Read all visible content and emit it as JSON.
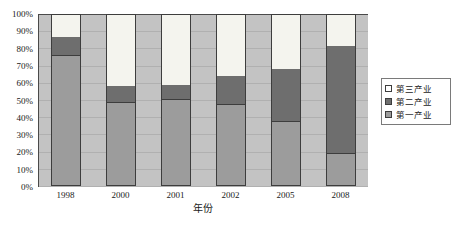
{
  "chart_data": {
    "type": "bar",
    "subtype": "100% stacked column",
    "title": "",
    "xlabel": "年份",
    "ylabel": "",
    "categories": [
      "1998",
      "2000",
      "2001",
      "2002",
      "2005",
      "2008"
    ],
    "series": [
      {
        "name": "第一产业",
        "color": "#9c9c9c",
        "values": [
          76,
          48,
          50,
          47,
          37,
          18
        ]
      },
      {
        "name": "第二产业",
        "color": "#6e6e6e",
        "values": [
          11,
          10,
          9,
          17,
          31,
          64
        ]
      },
      {
        "name": "第三产业",
        "color": "#ffffff",
        "values": [
          13,
          42,
          41,
          36,
          32,
          18
        ]
      }
    ],
    "stack_order_bottom_to_top": [
      "第一产业",
      "第二产业",
      "第三产业"
    ],
    "ylim": [
      0,
      100
    ],
    "yticks": [
      "0%",
      "10%",
      "20%",
      "30%",
      "40%",
      "50%",
      "60%",
      "70%",
      "80%",
      "90%",
      "100%"
    ],
    "ytick_values": [
      0,
      10,
      20,
      30,
      40,
      50,
      60,
      70,
      80,
      90,
      100
    ],
    "grid": true,
    "legend_position": "right",
    "plot_background": "#c3c3c3",
    "chart_background": "#ffffff"
  },
  "legend": {
    "items": [
      {
        "label": "第三产业",
        "swatch": "legend-swatch-tertiary"
      },
      {
        "label": "第二产业",
        "swatch": "legend-swatch-secondary"
      },
      {
        "label": "第一产业",
        "swatch": "legend-swatch-primary"
      }
    ]
  },
  "axis": {
    "x_title": "年份"
  }
}
